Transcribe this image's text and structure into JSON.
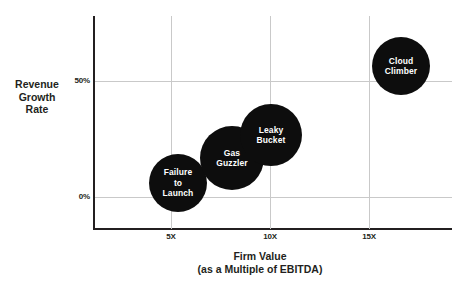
{
  "chart_data": {
    "type": "scatter",
    "title": "Firm Value\n(as a Multiple of EBITDA)",
    "xlabel": "Firm Value\n(as a Multiple of EBITDA)",
    "ylabel": "Revenue\nGrowth\nRate",
    "xlabel_line1": "Firm Value",
    "xlabel_line2": "(as a Multiple of EBITDA)",
    "ylabel_line1": "Revenue",
    "ylabel_line2": "Growth",
    "ylabel_line3": "Rate",
    "grid": true,
    "legend": "none",
    "xlim": [
      2,
      20
    ],
    "ylim": [
      -20,
      80
    ],
    "xticks": [
      "5X",
      "10X",
      "15X"
    ],
    "xtick_values": [
      5,
      10,
      15
    ],
    "yticks": [
      "0%",
      "50%"
    ],
    "ytick_values": [
      0,
      50
    ],
    "bubble_color": "#0d0d0d",
    "label_color": "#ffffff",
    "grid_color": "#c9c9c9",
    "axis_color": "#231f20",
    "points": [
      {
        "label": "Failure\nto\nLaunch",
        "name": "Failure to Launch",
        "x": 6,
        "y": 3,
        "r": 29,
        "cx": 178,
        "cy": 183
      },
      {
        "label": "Gas\nGuzzler",
        "name": "Gas Guzzler",
        "x": 8.7,
        "y": 14,
        "r": 32,
        "cx": 232,
        "cy": 158
      },
      {
        "label": "Leaky\nBucket",
        "name": "Leaky Bucket",
        "x": 10.5,
        "y": 24,
        "r": 31,
        "cx": 271,
        "cy": 135
      },
      {
        "label": "Cloud\nClimber",
        "name": "Cloud Climber",
        "x": 16.6,
        "y": 59,
        "r": 29,
        "cx": 401,
        "cy": 66
      }
    ]
  }
}
